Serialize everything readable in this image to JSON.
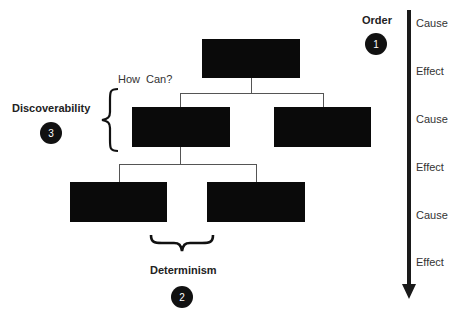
{
  "diagram": {
    "type": "hierarchy-tree",
    "nodes": [
      {
        "id": "root",
        "level": 0,
        "label": ""
      },
      {
        "id": "child-left",
        "level": 1,
        "parent": "root",
        "label": ""
      },
      {
        "id": "child-right",
        "level": 1,
        "parent": "root",
        "label": ""
      },
      {
        "id": "grandchild-left",
        "level": 2,
        "parent": "child-left",
        "label": ""
      },
      {
        "id": "grandchild-right",
        "level": 2,
        "parent": "child-left",
        "label": ""
      }
    ],
    "annotations": {
      "how_can": "How Can?",
      "discoverability": {
        "label": "Discoverability",
        "number": "3"
      },
      "determinism": {
        "label": "Determinism",
        "number": "2"
      },
      "order": {
        "label": "Order",
        "number": "1"
      }
    },
    "timeline": {
      "direction": "down",
      "steps": [
        "Cause",
        "Effect",
        "Cause",
        "Effect",
        "Cause",
        "Effect"
      ]
    }
  },
  "colors": {
    "box": "#0a0a0a",
    "connector": "#555555",
    "badge": "#111111",
    "arrow": "#1a1a1a"
  }
}
